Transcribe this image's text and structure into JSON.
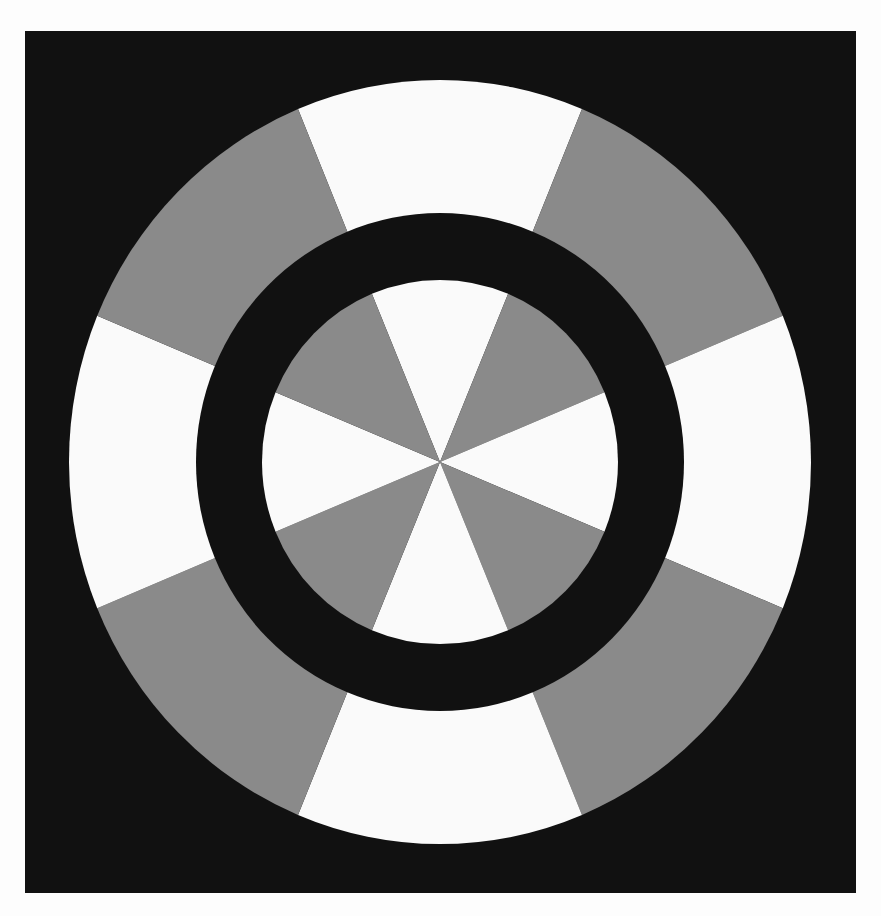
{
  "figure": {
    "kind": "illusion-target",
    "description": "Two concentric 8-sector alternating white/gray discs separated by a black ring, on a black square background",
    "colors": {
      "page_background": "#fdfdfd",
      "square_background": "#111111",
      "ring_black": "#111111",
      "sector_white": "#fafafa",
      "sector_gray": "#8a8a8a"
    },
    "background_square": {
      "x": 25,
      "y": 31,
      "width": 831,
      "height": 862
    },
    "center": {
      "x": 440,
      "y": 462
    },
    "outer_disc": {
      "rx": 371,
      "ry": 382,
      "sectors": 8,
      "first_sector_color": "white",
      "sector_centers_deg": [
        0,
        45,
        90,
        135,
        180,
        225,
        270,
        315
      ],
      "sector_colors": [
        "white",
        "gray",
        "white",
        "gray",
        "white",
        "gray",
        "white",
        "gray"
      ]
    },
    "separator_ring": {
      "rx": 244,
      "ry": 249
    },
    "inner_disc": {
      "rx": 178,
      "ry": 182,
      "sectors": 8,
      "sector_centers_deg": [
        0,
        45,
        90,
        135,
        180,
        225,
        270,
        315
      ],
      "sector_colors": [
        "white",
        "gray",
        "white",
        "gray",
        "white",
        "gray",
        "white",
        "gray"
      ]
    }
  }
}
